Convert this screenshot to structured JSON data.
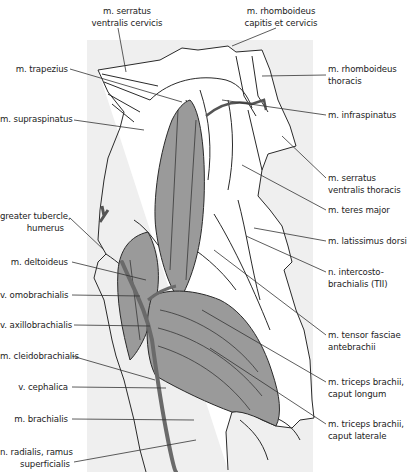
{
  "figure": {
    "colors": {
      "background": "#ffffff",
      "panel": "#efefef",
      "muscle_fill": "#9a9a9a",
      "outline": "#2a2a2a",
      "leader": "#333333"
    }
  },
  "labels_top": [
    {
      "id": "serratus-cervicis",
      "line1": "m. serratus",
      "line2": "ventralis cervicis"
    },
    {
      "id": "rhomboideus-capitis",
      "line1": "m. rhomboideus",
      "line2": "capitis et cervicis"
    }
  ],
  "labels_left": [
    {
      "id": "trapezius",
      "line1": "m. trapezius"
    },
    {
      "id": "supraspinatus",
      "line1": "m. supraspinatus"
    },
    {
      "id": "greater-tubercle",
      "line1": "greater tubercle,",
      "line2": "humerus"
    },
    {
      "id": "deltoideus",
      "line1": "m. deltoideus"
    },
    {
      "id": "omobrachialis",
      "line1": "v. omobrachialis"
    },
    {
      "id": "axillobrachialis",
      "line1": "v. axillobrachialis"
    },
    {
      "id": "cleidobrachialis",
      "line1": "m. cleidobrachialis"
    },
    {
      "id": "cephalica",
      "line1": "v. cephalica"
    },
    {
      "id": "brachialis",
      "line1": "m. brachialis"
    },
    {
      "id": "radialis",
      "line1": "n. radialis, ramus",
      "line2": "superficialis"
    }
  ],
  "labels_right": [
    {
      "id": "rhomboideus-thoracis",
      "line1": "m. rhomboideus",
      "line2": "thoracis"
    },
    {
      "id": "infraspinatus",
      "line1": "m. infraspinatus"
    },
    {
      "id": "serratus-thoracis",
      "line1": "m. serratus",
      "line2": "ventralis thoracis"
    },
    {
      "id": "teres-major",
      "line1": "m. teres major"
    },
    {
      "id": "latissimus",
      "line1": "m. latissimus dorsi"
    },
    {
      "id": "intercostobrachialis",
      "line1": "n. intercosto-",
      "line2": "brachialis (TII)"
    },
    {
      "id": "tensor-fasciae",
      "line1": "m. tensor fasciae",
      "line2": "antebrachii"
    },
    {
      "id": "triceps-longum",
      "line1": "m. triceps brachii,",
      "line2": "caput longum"
    },
    {
      "id": "triceps-laterale",
      "line1": "m. triceps brachii,",
      "line2": "caput laterale"
    }
  ]
}
